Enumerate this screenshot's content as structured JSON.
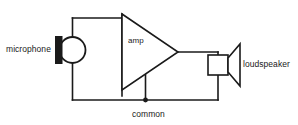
{
  "diagram": {
    "type": "schematic",
    "line_color": "#1a1a1a",
    "fill_color": "#1a1a1a",
    "background": "#ffffff",
    "labels": {
      "microphone": "microphone",
      "amp": "amp",
      "loudspeaker": "loudspeaker",
      "common": "common"
    },
    "components": [
      {
        "name": "microphone",
        "symbol": "circle-with-diaphragm-bar",
        "label": "microphone",
        "label_position": "left"
      },
      {
        "name": "amp",
        "symbol": "right-pointing-triangle",
        "label": "amp",
        "label_position": "inside"
      },
      {
        "name": "loudspeaker",
        "symbol": "square-with-horn",
        "label": "loudspeaker",
        "label_position": "right"
      },
      {
        "name": "common-rail",
        "symbol": "horizontal-wire-with-junction-dot",
        "label": "common",
        "label_position": "below"
      }
    ],
    "nets": [
      "microphone-to-amp-input (top rail)",
      "amp-output-to-loudspeaker (right rail)",
      "microphone-amp-loudspeaker-to-common (bottom rail)"
    ]
  }
}
